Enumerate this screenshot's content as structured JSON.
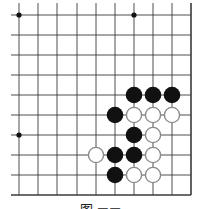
{
  "diagram": {
    "type": "go-board-fragment",
    "visible_grid": {
      "columns": 10,
      "rows": 10,
      "right_edge_is_board_edge": true,
      "bottom_edge_is_board_edge": true,
      "left_extends": true,
      "top_extends": true
    },
    "grid_x": [
      19,
      38,
      57,
      77,
      96,
      115,
      134,
      153,
      172,
      191
    ],
    "grid_y": [
      15,
      35,
      55,
      75,
      95,
      115,
      135,
      155,
      175,
      195
    ],
    "star_points": [
      {
        "col": 0,
        "row": 0
      },
      {
        "col": 6,
        "row": 0
      },
      {
        "col": 0,
        "row": 6
      }
    ],
    "stones": [
      {
        "color": "black",
        "col": 6,
        "row": 4
      },
      {
        "color": "black",
        "col": 7,
        "row": 4
      },
      {
        "color": "black",
        "col": 8,
        "row": 4
      },
      {
        "color": "black",
        "col": 5,
        "row": 5
      },
      {
        "color": "white",
        "col": 6,
        "row": 5
      },
      {
        "color": "white",
        "col": 7,
        "row": 5
      },
      {
        "color": "white",
        "col": 8,
        "row": 5
      },
      {
        "color": "black",
        "col": 6,
        "row": 6
      },
      {
        "color": "white",
        "col": 7,
        "row": 6
      },
      {
        "color": "white",
        "col": 4,
        "row": 7
      },
      {
        "color": "black",
        "col": 5,
        "row": 7
      },
      {
        "color": "black",
        "col": 6,
        "row": 7
      },
      {
        "color": "white",
        "col": 7,
        "row": 7
      },
      {
        "color": "black",
        "col": 5,
        "row": 8
      },
      {
        "color": "white",
        "col": 6,
        "row": 8
      },
      {
        "color": "white",
        "col": 7,
        "row": 8
      }
    ],
    "colors": {
      "line": "#3a3a3a",
      "black_stone": "#111111",
      "white_stone_fill": "#ffffff",
      "white_stone_stroke": "#8a8a8a"
    },
    "caption": "图 ▬▬"
  }
}
